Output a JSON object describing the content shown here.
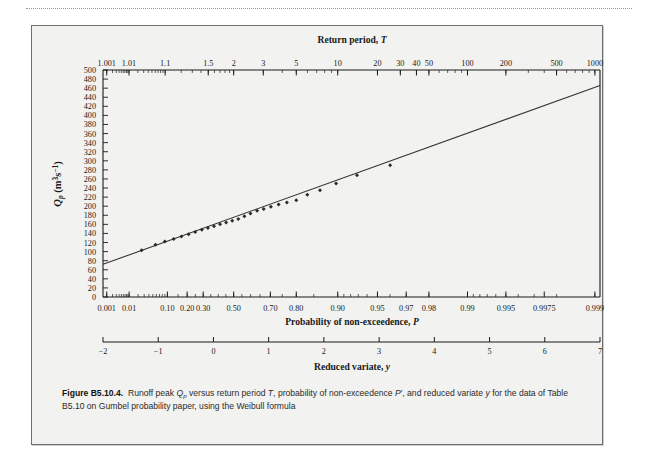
{
  "figure": {
    "number": "B5.10.4.",
    "label_prefix": "Figure",
    "caption_line1_a": "Runoff peak ",
    "caption_q": "Q",
    "caption_q_sub": "p",
    "caption_line1_b": " versus return period ",
    "caption_t": "T",
    "caption_line1_c": ", probability of non-exceedence ",
    "caption_p": "P",
    "caption_prime": "′",
    "caption_line1_d": ", and reduced variate ",
    "caption_y": "y",
    "caption_line2": "for the data of Table B5.10 on Gumbel probability paper, using the Weibull formula"
  },
  "axes": {
    "top": {
      "title_text": "Return period, ",
      "title_symbol": "T",
      "labels": [
        "1.001",
        "1.01",
        "1.1",
        "1.5",
        "2",
        "3",
        "5",
        "10",
        "20",
        "30",
        "40",
        "50",
        "100",
        "200",
        "500",
        "1000"
      ]
    },
    "bottom_prob": {
      "title_text": "Probability of non-exceedence, ",
      "title_symbol": "P",
      "labels": [
        "0.001",
        "0.01",
        "0.10",
        "0.20",
        "0.30",
        "0.50",
        "0.70",
        "0.80",
        "0.90",
        "0.95",
        "0.97",
        "0.98",
        "0.99",
        "0.995",
        "0.9975",
        "0.999"
      ]
    },
    "bottom_reduced": {
      "title_text": "Reduced variate, ",
      "title_symbol": "y",
      "labels": [
        "-2",
        "-1",
        "0",
        "1",
        "2",
        "3",
        "4",
        "5",
        "6",
        "7"
      ]
    },
    "y": {
      "title_q": "Q",
      "title_q_sub": "p",
      "title_units_a": " (m",
      "title_units_sup1": "3",
      "title_units_b": "s",
      "title_units_sup2": "−1",
      "title_units_c": ")",
      "labels": [
        "500",
        "480",
        "460",
        "440",
        "420",
        "400",
        "380",
        "360",
        "340",
        "320",
        "300",
        "280",
        "260",
        "240",
        "220",
        "200",
        "180",
        "160",
        "140",
        "120",
        "100",
        "80",
        "60",
        "40",
        "20",
        "0"
      ]
    }
  },
  "colors": {
    "panel": "#f2f2f0",
    "axis": "#1a1a1a",
    "data_point": "#2a2a2a",
    "fit_line": "#333333",
    "page": "#ffffff"
  },
  "chart_data": {
    "type": "scatter",
    "title": "",
    "xlabel": "Reduced variate, y",
    "ylabel": "Qp (m3 s-1)",
    "xlim": [
      -2,
      7
    ],
    "ylim": [
      0,
      500
    ],
    "grid": false,
    "legend": "none",
    "x_axis_note": "Gumbel probability paper: linear in reduced variate y; top axis is return period T, bottom axis is probability of non-exceedence P",
    "y_ticks": [
      0,
      20,
      40,
      60,
      80,
      100,
      120,
      140,
      160,
      180,
      200,
      220,
      240,
      260,
      280,
      300,
      320,
      340,
      360,
      380,
      400,
      420,
      440,
      460,
      480,
      500
    ],
    "fit_line": {
      "name": "Gumbel fit (Weibull plotting positions)",
      "x": [
        -2.0,
        7.0
      ],
      "y": [
        72,
        466
      ]
    },
    "series": [
      {
        "name": "Observed annual peaks Qp",
        "marker": "filled-diamond",
        "x": [
          -1.3,
          -1.05,
          -0.88,
          -0.72,
          -0.58,
          -0.45,
          -0.33,
          -0.21,
          -0.1,
          0.01,
          0.12,
          0.23,
          0.34,
          0.45,
          0.56,
          0.67,
          0.79,
          0.91,
          1.04,
          1.18,
          1.33,
          1.5,
          1.7,
          1.93,
          2.22,
          2.6,
          3.2
        ],
        "y": [
          103,
          115,
          122,
          128,
          133,
          138,
          143,
          148,
          152,
          156,
          160,
          164,
          168,
          172,
          178,
          184,
          190,
          194,
          199,
          204,
          208,
          213,
          225,
          235,
          250,
          268,
          290
        ]
      }
    ]
  }
}
